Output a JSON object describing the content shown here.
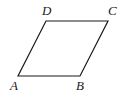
{
  "figure": {
    "shape": "parallelogram",
    "stroke_color": "#1a1a1a",
    "vertices": {
      "A": {
        "label": "A",
        "x": 18,
        "y": 76
      },
      "B": {
        "label": "B",
        "x": 80,
        "y": 76
      },
      "C": {
        "label": "C",
        "x": 108,
        "y": 21
      },
      "D": {
        "label": "D",
        "x": 46,
        "y": 21
      }
    }
  }
}
